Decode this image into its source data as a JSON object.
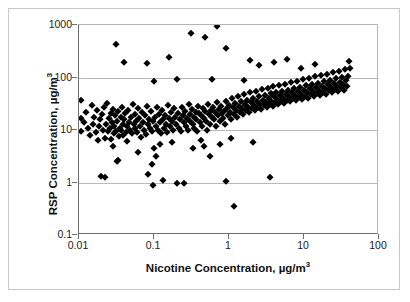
{
  "chart_data": {
    "type": "scatter",
    "title": "",
    "xlabel": "Nicotine Concentration, µg/m³",
    "ylabel": "RSP Concentration, µg/m³",
    "xlabel_main": "Nicotine Concentration, µg/m",
    "xlabel_sup": "3",
    "ylabel_main": "RSP Concentration, µg/m",
    "ylabel_sup": "3",
    "xscale": "log",
    "yscale": "log",
    "xlim": [
      0.01,
      100
    ],
    "ylim": [
      0.1,
      1000
    ],
    "grid": "horizontal-decades",
    "legend": "none",
    "marker": "filled-diamond",
    "marker_color": "#000000",
    "xticks": [
      "0.01",
      "0.1",
      "1",
      "10",
      "100"
    ],
    "xtick_values": [
      0.01,
      0.1,
      1,
      10,
      100
    ],
    "yticks": [
      "1000",
      "100",
      "10",
      "1",
      "0.1"
    ],
    "ytick_values": [
      1000,
      100,
      10,
      1,
      0.1
    ],
    "n_points": 288,
    "points": [
      [
        0.0105,
        38
      ],
      [
        0.0105,
        17
      ],
      [
        0.0105,
        9.6
      ],
      [
        0.0118,
        14
      ],
      [
        0.0125,
        22
      ],
      [
        0.0132,
        11
      ],
      [
        0.014,
        8.2
      ],
      [
        0.0148,
        30
      ],
      [
        0.0152,
        13
      ],
      [
        0.016,
        18
      ],
      [
        0.0168,
        9.0
      ],
      [
        0.0172,
        24
      ],
      [
        0.018,
        6.4
      ],
      [
        0.0185,
        12
      ],
      [
        0.019,
        16
      ],
      [
        0.0195,
        1.35
      ],
      [
        0.0205,
        20
      ],
      [
        0.021,
        10
      ],
      [
        0.0215,
        27
      ],
      [
        0.022,
        7.2
      ],
      [
        0.0228,
        13
      ],
      [
        0.0235,
        33
      ],
      [
        0.024,
        9.4
      ],
      [
        0.025,
        17
      ],
      [
        0.0258,
        11
      ],
      [
        0.0265,
        21
      ],
      [
        0.027,
        6.8
      ],
      [
        0.0278,
        14
      ],
      [
        0.0285,
        25
      ],
      [
        0.029,
        8.6
      ],
      [
        0.0295,
        12
      ],
      [
        0.0305,
        19
      ],
      [
        0.031,
        430
      ],
      [
        0.0315,
        9.8
      ],
      [
        0.032,
        15
      ],
      [
        0.0325,
        2.6
      ],
      [
        0.0335,
        23
      ],
      [
        0.034,
        7.6
      ],
      [
        0.035,
        11
      ],
      [
        0.0358,
        18
      ],
      [
        0.0365,
        10
      ],
      [
        0.0375,
        28
      ],
      [
        0.0385,
        13
      ],
      [
        0.039,
        8.0
      ],
      [
        0.04,
        16
      ],
      [
        0.041,
        21
      ],
      [
        0.042,
        9.2
      ],
      [
        0.043,
        12
      ],
      [
        0.044,
        6.2
      ],
      [
        0.0455,
        24
      ],
      [
        0.0465,
        14
      ],
      [
        0.048,
        10
      ],
      [
        0.0495,
        18
      ],
      [
        0.051,
        8.8
      ],
      [
        0.052,
        31
      ],
      [
        0.0535,
        13
      ],
      [
        0.055,
        20
      ],
      [
        0.0565,
        11
      ],
      [
        0.058,
        15
      ],
      [
        0.06,
        9.0
      ],
      [
        0.0615,
        26
      ],
      [
        0.063,
        17
      ],
      [
        0.065,
        12
      ],
      [
        0.067,
        7.4
      ],
      [
        0.069,
        22
      ],
      [
        0.071,
        14
      ],
      [
        0.0735,
        10
      ],
      [
        0.076,
        19
      ],
      [
        0.078,
        8.4
      ],
      [
        0.081,
        29
      ],
      [
        0.083,
        13
      ],
      [
        0.086,
        16
      ],
      [
        0.088,
        11
      ],
      [
        0.091,
        23
      ],
      [
        0.094,
        9.6
      ],
      [
        0.097,
        15
      ],
      [
        0.0995,
        4.5
      ],
      [
        0.1,
        85
      ],
      [
        0.103,
        18
      ],
      [
        0.106,
        12
      ],
      [
        0.109,
        27
      ],
      [
        0.112,
        10
      ],
      [
        0.116,
        20
      ],
      [
        0.119,
        14
      ],
      [
        0.123,
        8.6
      ],
      [
        0.127,
        24
      ],
      [
        0.131,
        16
      ],
      [
        0.135,
        11
      ],
      [
        0.139,
        19
      ],
      [
        0.143,
        13
      ],
      [
        0.148,
        9.2
      ],
      [
        0.152,
        30
      ],
      [
        0.157,
        17
      ],
      [
        0.162,
        12
      ],
      [
        0.167,
        22
      ],
      [
        0.172,
        15
      ],
      [
        0.178,
        10
      ],
      [
        0.183,
        26
      ],
      [
        0.189,
        18
      ],
      [
        0.195,
        13
      ],
      [
        0.2,
        95
      ],
      [
        0.206,
        21
      ],
      [
        0.212,
        11
      ],
      [
        0.219,
        16
      ],
      [
        0.226,
        9.4
      ],
      [
        0.233,
        28
      ],
      [
        0.24,
        19
      ],
      [
        0.247,
        14
      ],
      [
        0.255,
        23
      ],
      [
        0.263,
        12
      ],
      [
        0.271,
        17
      ],
      [
        0.28,
        10
      ],
      [
        0.288,
        32
      ],
      [
        0.297,
        20
      ],
      [
        0.306,
        15
      ],
      [
        0.316,
        25
      ],
      [
        0.326,
        13
      ],
      [
        0.336,
        18
      ],
      [
        0.346,
        11
      ],
      [
        0.357,
        22
      ],
      [
        0.368,
        16
      ],
      [
        0.379,
        9.8
      ],
      [
        0.391,
        29
      ],
      [
        0.403,
        21
      ],
      [
        0.416,
        14
      ],
      [
        0.428,
        19
      ],
      [
        0.441,
        12
      ],
      [
        0.455,
        26
      ],
      [
        0.469,
        17
      ],
      [
        0.484,
        23
      ],
      [
        0.499,
        15
      ],
      [
        0.514,
        10
      ],
      [
        0.53,
        31
      ],
      [
        0.546,
        20
      ],
      [
        0.563,
        13
      ],
      [
        0.58,
        24
      ],
      [
        0.598,
        18
      ],
      [
        0.617,
        27
      ],
      [
        0.636,
        16
      ],
      [
        0.655,
        22
      ],
      [
        0.675,
        12
      ],
      [
        0.696,
        34
      ],
      [
        0.718,
        19
      ],
      [
        0.74,
        25
      ],
      [
        0.763,
        15
      ],
      [
        0.786,
        29
      ],
      [
        0.81,
        21
      ],
      [
        0.835,
        17
      ],
      [
        0.861,
        23
      ],
      [
        0.888,
        13
      ],
      [
        0.915,
        36
      ],
      [
        0.943,
        26
      ],
      [
        0.972,
        19
      ],
      [
        1.0,
        30
      ],
      [
        1.03,
        22
      ],
      [
        1.06,
        16
      ],
      [
        1.1,
        40
      ],
      [
        1.13,
        27
      ],
      [
        1.16,
        20
      ],
      [
        1.2,
        33
      ],
      [
        1.24,
        24
      ],
      [
        1.27,
        18
      ],
      [
        1.31,
        44
      ],
      [
        1.35,
        29
      ],
      [
        1.39,
        22
      ],
      [
        1.44,
        35
      ],
      [
        1.48,
        26
      ],
      [
        1.53,
        20
      ],
      [
        1.57,
        48
      ],
      [
        1.62,
        31
      ],
      [
        1.67,
        24
      ],
      [
        1.72,
        38
      ],
      [
        1.78,
        28
      ],
      [
        1.83,
        22
      ],
      [
        1.89,
        52
      ],
      [
        1.95,
        34
      ],
      [
        2.0,
        26
      ],
      [
        2.07,
        41
      ],
      [
        2.13,
        30
      ],
      [
        2.2,
        24
      ],
      [
        2.27,
        56
      ],
      [
        2.34,
        36
      ],
      [
        2.41,
        28
      ],
      [
        2.48,
        44
      ],
      [
        2.56,
        32
      ],
      [
        2.64,
        25
      ],
      [
        2.72,
        60
      ],
      [
        2.8,
        38
      ],
      [
        2.89,
        30
      ],
      [
        2.98,
        47
      ],
      [
        3.07,
        34
      ],
      [
        3.16,
        27
      ],
      [
        3.26,
        64
      ],
      [
        3.36,
        41
      ],
      [
        3.47,
        32
      ],
      [
        3.57,
        50
      ],
      [
        3.68,
        36
      ],
      [
        3.8,
        29
      ],
      [
        3.91,
        68
      ],
      [
        4.03,
        44
      ],
      [
        4.16,
        34
      ],
      [
        4.29,
        53
      ],
      [
        4.42,
        39
      ],
      [
        4.56,
        31
      ],
      [
        4.7,
        72
      ],
      [
        4.84,
        46
      ],
      [
        4.99,
        36
      ],
      [
        5.15,
        56
      ],
      [
        5.31,
        41
      ],
      [
        5.47,
        33
      ],
      [
        5.64,
        77
      ],
      [
        5.81,
        49
      ],
      [
        5.99,
        38
      ],
      [
        6.18,
        59
      ],
      [
        6.37,
        44
      ],
      [
        6.57,
        35
      ],
      [
        6.77,
        82
      ],
      [
        6.98,
        52
      ],
      [
        7.2,
        40
      ],
      [
        7.42,
        63
      ],
      [
        7.65,
        46
      ],
      [
        7.89,
        37
      ],
      [
        8.13,
        87
      ],
      [
        8.38,
        55
      ],
      [
        8.64,
        43
      ],
      [
        8.91,
        67
      ],
      [
        9.19,
        49
      ],
      [
        9.47,
        39
      ],
      [
        9.77,
        93
      ],
      [
        10.1,
        58
      ],
      [
        10.4,
        45
      ],
      [
        10.7,
        71
      ],
      [
        11.0,
        52
      ],
      [
        11.4,
        41
      ],
      [
        11.7,
        99
      ],
      [
        12.1,
        62
      ],
      [
        12.5,
        48
      ],
      [
        12.9,
        75
      ],
      [
        13.3,
        55
      ],
      [
        13.7,
        44
      ],
      [
        14.1,
        105
      ],
      [
        14.6,
        66
      ],
      [
        15.0,
        51
      ],
      [
        15.5,
        80
      ],
      [
        16.0,
        58
      ],
      [
        16.5,
        46
      ],
      [
        17.0,
        112
      ],
      [
        17.5,
        70
      ],
      [
        18.1,
        54
      ],
      [
        18.6,
        85
      ],
      [
        19.2,
        62
      ],
      [
        19.8,
        49
      ],
      [
        20.4,
        119
      ],
      [
        21.1,
        74
      ],
      [
        21.7,
        57
      ],
      [
        22.4,
        90
      ],
      [
        23.1,
        66
      ],
      [
        23.8,
        52
      ],
      [
        24.6,
        127
      ],
      [
        25.3,
        79
      ],
      [
        26.1,
        61
      ],
      [
        26.9,
        96
      ],
      [
        27.8,
        70
      ],
      [
        28.6,
        55
      ],
      [
        29.5,
        135
      ],
      [
        30.4,
        84
      ],
      [
        31.4,
        65
      ],
      [
        32.4,
        102
      ],
      [
        33.4,
        74
      ],
      [
        34.4,
        58
      ],
      [
        35.5,
        143
      ],
      [
        36.6,
        89
      ],
      [
        37.7,
        69
      ],
      [
        38.9,
        108
      ],
      [
        40.1,
        205
      ],
      [
        41.4,
        150
      ],
      [
        0.04,
        200
      ],
      [
        0.08,
        190
      ],
      [
        0.16,
        250
      ],
      [
        0.31,
        700
      ],
      [
        0.6,
        95
      ],
      [
        0.9,
        360
      ],
      [
        1.6,
        90
      ],
      [
        2.5,
        170
      ],
      [
        4.0,
        200
      ],
      [
        6.0,
        230
      ],
      [
        9.0,
        150
      ],
      [
        14.0,
        180
      ],
      [
        0.022,
        1.3
      ],
      [
        0.033,
        2.7
      ],
      [
        0.082,
        1.45
      ],
      [
        0.095,
        2.3
      ],
      [
        0.098,
        0.9
      ],
      [
        0.13,
        1.1
      ],
      [
        0.25,
        1.0
      ],
      [
        0.9,
        1.05
      ],
      [
        1.15,
        0.35
      ],
      [
        3.5,
        1.3
      ],
      [
        0.2,
        1.0
      ],
      [
        0.55,
        3.2
      ],
      [
        0.33,
        4.6
      ],
      [
        0.46,
        5.0
      ],
      [
        0.12,
        5.4
      ],
      [
        0.028,
        4.9
      ],
      [
        0.062,
        3.8
      ],
      [
        0.105,
        3.2
      ],
      [
        0.175,
        6.0
      ],
      [
        0.42,
        6.5
      ],
      [
        0.75,
        5.5
      ],
      [
        1.05,
        7.0
      ],
      [
        2.1,
        5.8
      ],
      [
        0.7,
        960
      ],
      [
        0.48,
        580
      ],
      [
        1.9,
        215
      ]
    ]
  }
}
